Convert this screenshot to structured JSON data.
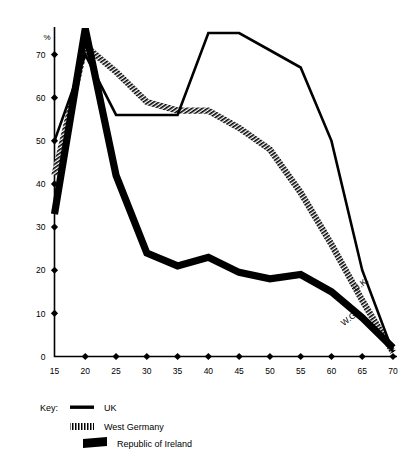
{
  "chart_data": {
    "type": "line",
    "title": "",
    "subtitle": "",
    "xlabel": "",
    "ylabel": "%",
    "yunit_label": "%",
    "xlim": [
      15,
      70
    ],
    "ylim": [
      0,
      75
    ],
    "grid": false,
    "legend_position": "below-left",
    "x": [
      15,
      20,
      25,
      30,
      35,
      40,
      45,
      50,
      55,
      60,
      65,
      70
    ],
    "xticks": [
      "15",
      "20",
      "25",
      "30",
      "35",
      "40",
      "45",
      "50",
      "55",
      "60",
      "65",
      "70"
    ],
    "yticks": [
      "0",
      "10",
      "20",
      "30",
      "40",
      "50",
      "60",
      "70"
    ],
    "ytick_values": [
      0,
      10,
      20,
      30,
      40,
      50,
      60,
      70
    ],
    "series": [
      {
        "name": "UK",
        "key_label": "UK",
        "inline_label": "U.K.",
        "style": "thin-solid-black",
        "color": "#000000",
        "values": [
          50,
          70,
          56,
          56,
          56,
          75,
          75,
          71,
          67,
          50,
          20,
          1
        ]
      },
      {
        "name": "West Germany",
        "key_label": "West Germany",
        "inline_label": "W.G.",
        "style": "hatched-black",
        "color": "#000000",
        "values": [
          42,
          72,
          66,
          59,
          57,
          57,
          53,
          48,
          38,
          26,
          13,
          1
        ]
      },
      {
        "name": "Republic of Ireland",
        "key_label": "Republic of Ireland",
        "inline_label": "",
        "style": "thick-solid-black",
        "color": "#000000",
        "values": [
          33,
          76,
          42,
          24,
          21,
          23,
          19.5,
          18,
          19,
          15,
          9,
          2
        ]
      }
    ],
    "annotations": [
      {
        "text": "U.K.",
        "x": 64,
        "y": 15,
        "rotation": -38
      },
      {
        "text": "W.G.",
        "x": 62,
        "y": 7,
        "rotation": -38
      }
    ]
  },
  "legend": {
    "key_label": "Key:",
    "items": [
      {
        "label": "UK",
        "swatch": "thin-solid-black"
      },
      {
        "label": "West Germany",
        "swatch": "hatched-black"
      },
      {
        "label": "Republic of Ireland",
        "swatch": "thick-solid-black"
      }
    ]
  }
}
